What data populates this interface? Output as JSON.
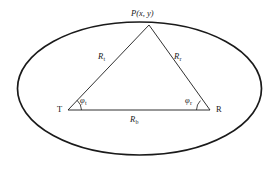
{
  "figure": {
    "name": "bistatic-geometry-diagram",
    "background_color": "#ffffff",
    "stroke_color": "#1a1a1a",
    "ellipse": {
      "label": "iso-range-ellipse",
      "center_x": 139.5,
      "center_y": 88.5,
      "radius_x": 122,
      "radius_y": 66.5,
      "stroke_width": 1.6
    },
    "vertices": {
      "apex": {
        "label": "P(x, y)",
        "symbol": "P",
        "arg_x": "x",
        "arg_y": "y",
        "x": 149,
        "y": 25
      },
      "left": {
        "label": "T",
        "x": 68,
        "y": 110
      },
      "right": {
        "label": "R",
        "x": 210,
        "y": 110
      }
    },
    "sides": [
      {
        "name": "transmitter-range",
        "symbol": "R",
        "subscript": "t",
        "label": "R",
        "x": 101,
        "y": 56
      },
      {
        "name": "receiver-range",
        "symbol": "R",
        "subscript": "r",
        "label": "R",
        "x": 176,
        "y": 56
      },
      {
        "name": "baseline-range",
        "symbol": "R",
        "subscript": "b",
        "label": "R",
        "x": 131,
        "y": 115
      }
    ],
    "angles": [
      {
        "name": "transmitter-angle",
        "symbol": "φ",
        "subscript": "t",
        "x": 80,
        "y": 97,
        "arc_radius": 13
      },
      {
        "name": "receiver-angle",
        "symbol": "φ",
        "subscript": "r",
        "x": 185,
        "y": 97,
        "arc_radius": 13
      }
    ]
  }
}
